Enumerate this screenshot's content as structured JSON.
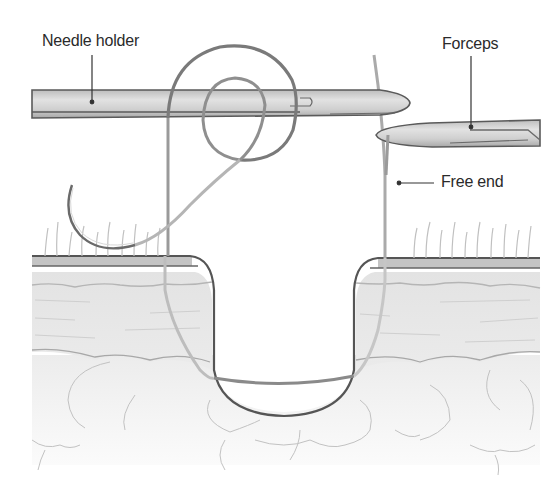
{
  "figure": {
    "labels": {
      "needle_holder": "Needle holder",
      "forceps": "Forceps",
      "free_end": "Free end"
    },
    "colors": {
      "background": "#ffffff",
      "outline": "#4a4a4a",
      "instrument_fill": "#d4d4d4",
      "epidermis": "#c9c9c9",
      "dermis": "#e6e6e6",
      "fat": "#f3f3f3",
      "suture": "#8a8a8a",
      "label_text": "#2a2a2a"
    }
  }
}
